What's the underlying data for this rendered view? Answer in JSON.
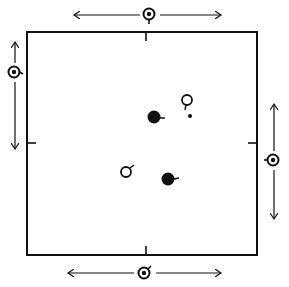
{
  "diagram": {
    "colors": {
      "ink": "#111111",
      "background": "#ffffff"
    },
    "arena": {
      "x": 27,
      "y": 32,
      "width": 230,
      "height": 223
    },
    "edge_ticks": [
      {
        "side": "top",
        "x": 146,
        "y": 32
      },
      {
        "side": "left",
        "x": 27,
        "y": 143
      },
      {
        "side": "right",
        "x": 257,
        "y": 143
      },
      {
        "side": "bottom",
        "x": 146,
        "y": 255
      }
    ],
    "peripheral_markers": [
      {
        "id": "top",
        "symbol": "ringed-dot-male",
        "cx": 149,
        "cy": 14,
        "arrow": "horizontal",
        "from": 72,
        "to": 222
      },
      {
        "id": "left",
        "symbol": "ringed-dot-female",
        "cx": 14,
        "cy": 72,
        "arrow": "vertical",
        "from": 40,
        "to": 150
      },
      {
        "id": "right",
        "symbol": "ringed-dot-female",
        "cx": 273,
        "cy": 160,
        "arrow": "vertical",
        "from": 103,
        "to": 220
      },
      {
        "id": "bottom",
        "symbol": "ringed-dot-male",
        "cx": 144,
        "cy": 273,
        "arrow": "horizontal",
        "from": 67,
        "to": 222
      }
    ],
    "interior_symbols": [
      {
        "id": "filled-female-upper",
        "type": "filled-circle",
        "cx": 154,
        "cy": 117,
        "r": 7,
        "stem": "right"
      },
      {
        "id": "open-female-upper",
        "type": "open-circle",
        "cx": 187,
        "cy": 100,
        "r": 5,
        "stem": "down"
      },
      {
        "id": "small-dot",
        "type": "dot",
        "cx": 190,
        "cy": 116,
        "r": 2
      },
      {
        "id": "open-male-lower",
        "type": "open-circle",
        "cx": 126,
        "cy": 172,
        "r": 5,
        "stem": "up-right"
      },
      {
        "id": "filled-female-lower",
        "type": "filled-circle",
        "cx": 168,
        "cy": 179,
        "r": 7,
        "stem": "right"
      }
    ]
  }
}
